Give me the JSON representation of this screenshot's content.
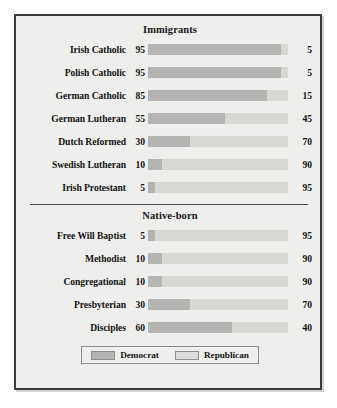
{
  "chart_data": {
    "type": "bar",
    "subtype": "stacked-horizontal-100pct",
    "title": "",
    "xlabel": "",
    "ylabel": "",
    "xlim": [
      0,
      100
    ],
    "grid": false,
    "legend_position": "bottom-center",
    "legend": [
      "Democrat",
      "Republican"
    ],
    "series": [
      {
        "name": "Democrat",
        "color": "#b4b4b2"
      },
      {
        "name": "Republican",
        "color": "#d7d7d4"
      }
    ],
    "groups": [
      {
        "title": "Immigrants",
        "categories": [
          "Irish Catholic",
          "Polish Catholic",
          "German Catholic",
          "German Lutheran",
          "Dutch Reformed",
          "Swedish Lutheran",
          "Irish Protestant"
        ],
        "democrat": [
          95,
          95,
          85,
          55,
          30,
          10,
          5
        ],
        "republican": [
          5,
          5,
          15,
          45,
          70,
          90,
          95
        ]
      },
      {
        "title": "Native-born",
        "categories": [
          "Free Will Baptist",
          "Methodist",
          "Congregational",
          "Presbyterian",
          "Disciples"
        ],
        "democrat": [
          5,
          10,
          10,
          30,
          60
        ],
        "republican": [
          95,
          90,
          90,
          70,
          40
        ]
      }
    ]
  },
  "sections": [
    {
      "title": "Immigrants",
      "rows": [
        {
          "label": "Irish Catholic",
          "democrat": 95,
          "republican": 5
        },
        {
          "label": "Polish Catholic",
          "democrat": 95,
          "republican": 5
        },
        {
          "label": "German Catholic",
          "democrat": 85,
          "republican": 15
        },
        {
          "label": "German Lutheran",
          "democrat": 55,
          "republican": 45
        },
        {
          "label": "Dutch Reformed",
          "democrat": 30,
          "republican": 70
        },
        {
          "label": "Swedish Lutheran",
          "democrat": 10,
          "republican": 90
        },
        {
          "label": "Irish Protestant",
          "democrat": 5,
          "republican": 95
        }
      ]
    },
    {
      "title": "Native-born",
      "rows": [
        {
          "label": "Free Will Baptist",
          "democrat": 5,
          "republican": 95
        },
        {
          "label": "Methodist",
          "democrat": 10,
          "republican": 90
        },
        {
          "label": "Congregational",
          "democrat": 10,
          "republican": 90
        },
        {
          "label": "Presbyterian",
          "democrat": 30,
          "republican": 70
        },
        {
          "label": "Disciples",
          "democrat": 60,
          "republican": 40
        }
      ]
    }
  ],
  "legend": {
    "items": [
      {
        "label": "Democrat",
        "color": "#b4b4b2"
      },
      {
        "label": "Republican",
        "color": "#d7d7d4"
      }
    ]
  },
  "colors": {
    "democrat": "#b4b4b2",
    "republican": "#d7d7d4",
    "background": "#eeeeec",
    "frame": "#3b3b3b",
    "text": "#131313"
  }
}
